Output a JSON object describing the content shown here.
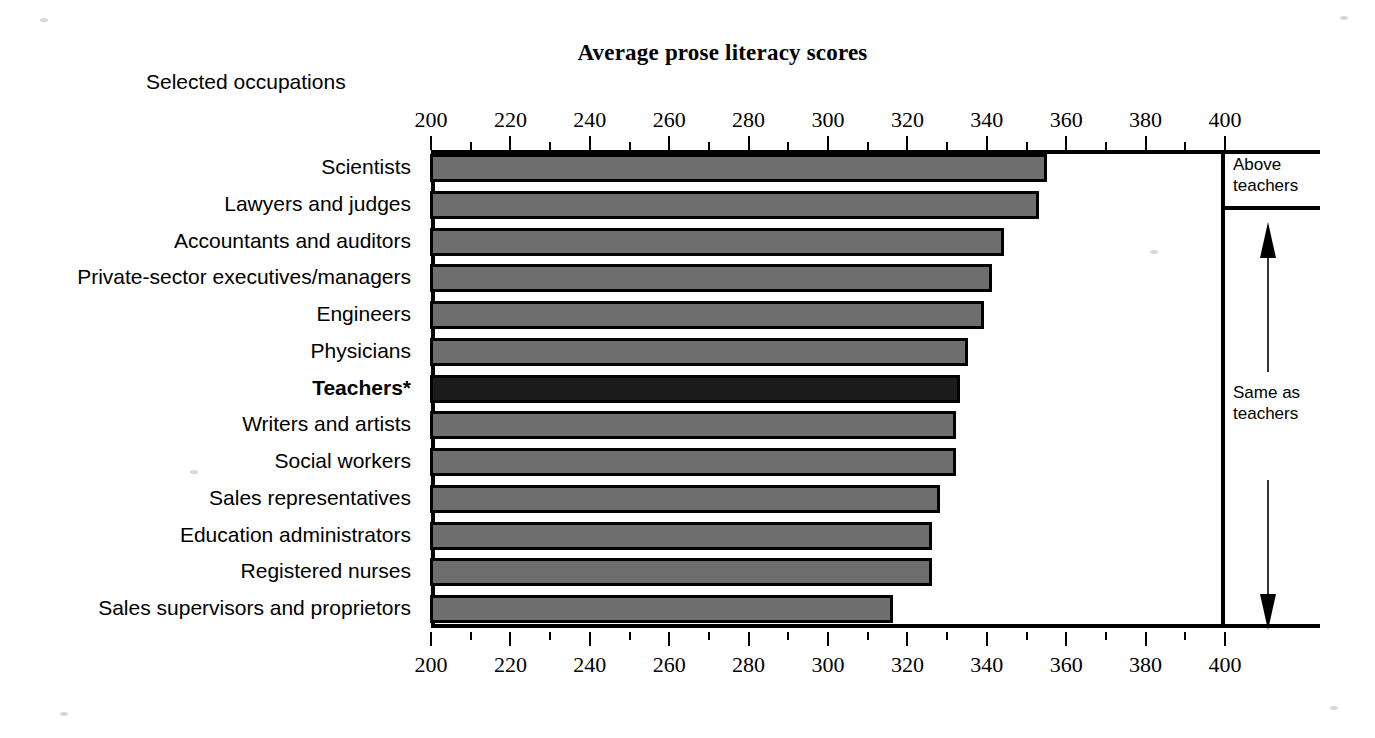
{
  "chart_data": {
    "type": "bar",
    "orientation": "horizontal",
    "title": "Average prose literacy scores",
    "xlabel": "",
    "ylabel": "Selected occupations",
    "xlim": [
      200,
      400
    ],
    "major_step": 20,
    "minor_step": 10,
    "grid": false,
    "legend": null,
    "tick_labels": [
      "200",
      "220",
      "240",
      "260",
      "280",
      "300",
      "320",
      "340",
      "360",
      "380",
      "400"
    ],
    "tick_values": [
      200,
      220,
      240,
      260,
      280,
      300,
      320,
      340,
      360,
      380,
      400
    ],
    "axis_top_duplicated": true,
    "axis_bottom_duplicated": true,
    "categories": [
      "Scientists",
      "Lawyers and judges",
      "Accountants and auditors",
      "Private-sector executives/managers",
      "Engineers",
      "Physicians",
      "Teachers*",
      "Writers and artists",
      "Social workers",
      "Sales representatives",
      "Education administrators",
      "Registered nurses",
      "Sales supervisors and proprietors"
    ],
    "values": [
      355,
      353,
      344,
      341,
      339,
      335,
      333,
      332,
      332,
      328,
      326,
      326,
      316
    ],
    "highlight_category": "Teachers*",
    "highlight_index": 6,
    "bar_color": "#6e6e6e",
    "highlight_color": "#1b1b1b",
    "bar_edge_color": "#000000",
    "annotations": [
      {
        "label": "Above\nteachers",
        "from_index": 0,
        "to_index": 1,
        "arrow": null
      },
      {
        "label": "Same as\nteachers",
        "from_index": 2,
        "to_index": 12,
        "arrow": "up-and-down"
      }
    ]
  },
  "header": {
    "title": "Average prose literacy scores",
    "y_caption": "Selected occupations"
  },
  "annotations": {
    "above_teachers_line1": "Above",
    "above_teachers_line2": "teachers",
    "same_as_teachers_line1": "Same as",
    "same_as_teachers_line2": "teachers"
  },
  "colors": {
    "bar": "#6e6e6e",
    "bar_highlight": "#1b1b1b",
    "outline": "#000000",
    "background": "#ffffff"
  }
}
